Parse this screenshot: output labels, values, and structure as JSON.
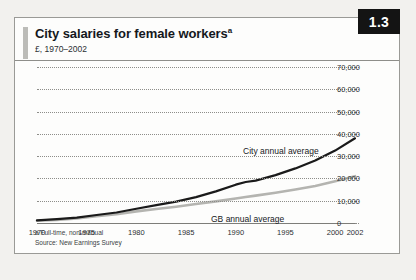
{
  "figure": {
    "badge": "1.3",
    "title": "City salaries for female workers",
    "title_superscript": "a",
    "subtitle": "£, 1970–2002",
    "footnote_a": "a Full-time, non-manual",
    "footnote_source": "Source: New Earnings Survey"
  },
  "chart_data": {
    "type": "line",
    "title": "City salaries for female workers",
    "subtitle": "£, 1970–2002",
    "xlabel": "",
    "ylabel": "£",
    "xlim": [
      1970,
      2002
    ],
    "ylim": [
      0,
      70000
    ],
    "grid": true,
    "legend_position": "inline-annotations",
    "ytick_labels": [
      "70,000",
      "60,000",
      "50,000",
      "40,000",
      "30,000",
      "20,000",
      "10,000",
      "0"
    ],
    "yticks": [
      70000,
      60000,
      50000,
      40000,
      30000,
      20000,
      10000,
      0
    ],
    "xtick_labels": [
      "1970",
      "1975",
      "1980",
      "1985",
      "1990",
      "1995",
      "2000",
      "2002"
    ],
    "xticks": [
      1970,
      1975,
      1980,
      1985,
      1990,
      1995,
      2000,
      2002
    ],
    "x": [
      1970,
      1972,
      1974,
      1976,
      1978,
      1980,
      1982,
      1984,
      1986,
      1988,
      1990,
      1991,
      1992,
      1994,
      1996,
      1998,
      2000,
      2002
    ],
    "series": [
      {
        "name": "City annual average",
        "color": "#1a1a1a",
        "values": [
          1200,
          1700,
          2400,
          3600,
          4700,
          6400,
          8000,
          9600,
          11600,
          14200,
          17200,
          18400,
          19000,
          21500,
          24500,
          28000,
          32500,
          38000
        ]
      },
      {
        "name": "GB annual average",
        "color": "#b4b4b0",
        "values": [
          1000,
          1400,
          2000,
          3000,
          3900,
          5200,
          6300,
          7300,
          8500,
          9700,
          11000,
          11700,
          12300,
          13600,
          15000,
          16600,
          18700,
          21000
        ]
      }
    ],
    "annotations": [
      {
        "text": "City annual average",
        "x": 1994,
        "y": 41000
      },
      {
        "text": "GB annual average",
        "x": 1991,
        "y": 5500
      }
    ]
  }
}
